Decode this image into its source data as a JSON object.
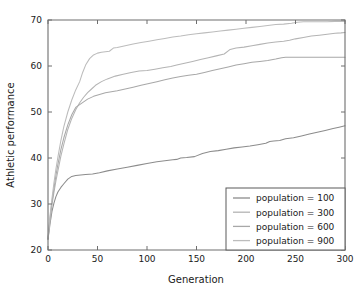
{
  "chart_data": {
    "type": "line",
    "title": "",
    "xlabel": "Generation",
    "ylabel": "Athletic performance",
    "xlim": [
      0,
      300
    ],
    "ylim": [
      20,
      70
    ],
    "xticks": [
      0,
      50,
      100,
      150,
      200,
      250,
      300
    ],
    "yticks": [
      20,
      30,
      40,
      50,
      60,
      70
    ],
    "xtick_labels": [
      "0",
      "50",
      "100",
      "150",
      "200",
      "250",
      "300"
    ],
    "ytick_labels": [
      "20",
      "30",
      "40",
      "50",
      "60",
      "70"
    ],
    "grid": false,
    "legend_position": "lower right",
    "colors": {
      "series_100": "#8c8c8c",
      "series_300": "#b4b4b4",
      "series_600": "#a8a8a8",
      "series_900": "#bcbcbc",
      "axis": "#6e6e6e",
      "text": "#1a1a1a",
      "background": "#ffffff"
    },
    "series": [
      {
        "name": "population = 100",
        "color": "#8c8c8c",
        "x": [
          0,
          2,
          4,
          6,
          8,
          10,
          13,
          16,
          20,
          24,
          28,
          33,
          38,
          45,
          52,
          60,
          70,
          80,
          90,
          100,
          110,
          118,
          126,
          130,
          134,
          140,
          148,
          156,
          164,
          172,
          180,
          188,
          196,
          204,
          212,
          220,
          224,
          228,
          234,
          240,
          248,
          256,
          264,
          272,
          280,
          288,
          294,
          300
        ],
        "y": [
          22.3,
          25.6,
          28.4,
          30.2,
          31.6,
          32.6,
          33.6,
          34.4,
          35.4,
          36.0,
          36.2,
          36.3,
          36.4,
          36.5,
          36.8,
          37.2,
          37.6,
          38.0,
          38.4,
          38.8,
          39.2,
          39.4,
          39.6,
          39.7,
          40.0,
          40.1,
          40.3,
          41.0,
          41.4,
          41.6,
          41.9,
          42.2,
          42.4,
          42.6,
          42.9,
          43.2,
          43.6,
          43.7,
          43.8,
          44.2,
          44.4,
          44.8,
          45.2,
          45.6,
          46.0,
          46.4,
          46.7,
          47.0
        ]
      },
      {
        "name": "population = 300",
        "color": "#b4b4b4",
        "x": [
          0,
          2,
          4,
          6,
          8,
          10,
          13,
          16,
          20,
          24,
          28,
          32,
          36,
          40,
          44,
          48,
          54,
          60,
          68,
          76,
          84,
          92,
          100,
          108,
          116,
          124,
          130,
          138,
          146,
          154,
          162,
          170,
          178,
          184,
          190,
          198,
          206,
          214,
          222,
          230,
          238,
          244,
          250,
          258,
          266,
          274,
          282,
          290,
          296,
          300
        ],
        "y": [
          22.5,
          26.2,
          29.8,
          32.5,
          35.0,
          37.2,
          40.4,
          43.0,
          46.2,
          48.6,
          50.5,
          52.0,
          53.2,
          54.2,
          55.0,
          55.8,
          56.6,
          57.2,
          57.8,
          58.2,
          58.6,
          58.9,
          59.0,
          59.3,
          59.6,
          59.9,
          60.2,
          60.6,
          61.0,
          61.4,
          61.8,
          62.2,
          62.6,
          63.6,
          63.9,
          64.1,
          64.4,
          64.7,
          65.0,
          65.2,
          65.4,
          65.6,
          65.9,
          66.2,
          66.5,
          66.7,
          66.9,
          67.1,
          67.2,
          67.3
        ]
      },
      {
        "name": "population = 600",
        "color": "#a8a8a8",
        "x": [
          0,
          2,
          4,
          6,
          8,
          10,
          13,
          16,
          20,
          24,
          28,
          32,
          36,
          40,
          46,
          52,
          58,
          64,
          70,
          78,
          86,
          94,
          102,
          110,
          118,
          126,
          134,
          142,
          150,
          158,
          166,
          174,
          182,
          190,
          198,
          206,
          214,
          222,
          230,
          236,
          240,
          248,
          256,
          264,
          272,
          280,
          288,
          294,
          300
        ],
        "y": [
          22.4,
          26.8,
          30.4,
          33.4,
          36.2,
          38.6,
          41.8,
          44.4,
          47.2,
          49.4,
          51.0,
          51.6,
          52.2,
          52.8,
          53.4,
          53.8,
          54.2,
          54.4,
          54.6,
          55.0,
          55.4,
          55.8,
          56.2,
          56.6,
          57.0,
          57.4,
          57.7,
          58.0,
          58.2,
          58.6,
          59.0,
          59.4,
          59.8,
          60.2,
          60.5,
          60.8,
          61.0,
          61.2,
          61.5,
          61.8,
          61.9,
          61.9,
          61.9,
          61.9,
          61.9,
          61.9,
          61.9,
          61.9,
          61.9
        ]
      },
      {
        "name": "population = 900",
        "color": "#bcbcbc",
        "x": [
          0,
          2,
          4,
          6,
          8,
          10,
          13,
          16,
          20,
          24,
          28,
          32,
          35,
          38,
          42,
          46,
          50,
          54,
          58,
          62,
          66,
          70,
          78,
          86,
          94,
          102,
          110,
          118,
          126,
          134,
          142,
          150,
          158,
          166,
          174,
          182,
          190,
          198,
          206,
          214,
          222,
          230,
          238,
          246,
          252,
          258,
          266,
          274,
          282,
          290,
          296,
          300
        ],
        "y": [
          22.6,
          27.4,
          31.2,
          34.6,
          37.6,
          40.2,
          43.8,
          46.8,
          50.0,
          52.6,
          54.8,
          56.6,
          58.6,
          60.2,
          61.6,
          62.4,
          62.8,
          63.0,
          63.1,
          63.2,
          63.9,
          64.0,
          64.4,
          64.8,
          65.1,
          65.4,
          65.7,
          66.0,
          66.3,
          66.5,
          66.8,
          67.0,
          67.2,
          67.4,
          67.6,
          67.8,
          68.0,
          68.2,
          68.4,
          68.6,
          68.8,
          69.0,
          69.1,
          69.3,
          69.5,
          69.6,
          69.6,
          69.6,
          69.6,
          69.7,
          69.7,
          69.7
        ]
      }
    ]
  },
  "legend": {
    "items": [
      {
        "label": "population = 100"
      },
      {
        "label": "population = 300"
      },
      {
        "label": "population = 600"
      },
      {
        "label": "population = 900"
      }
    ]
  }
}
